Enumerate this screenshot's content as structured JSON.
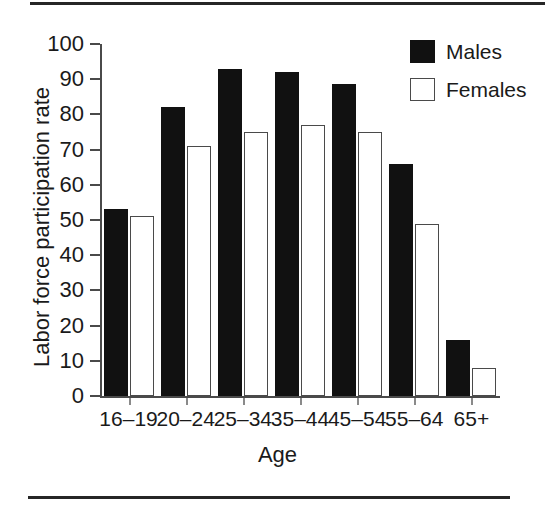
{
  "figure": {
    "has_top_rule": true,
    "has_bottom_rule": true
  },
  "legend": {
    "position": "top-right",
    "entries": [
      {
        "label": "Males",
        "swatch": "filled-black-square",
        "color": "#111111"
      },
      {
        "label": "Females",
        "swatch": "open-white-square",
        "color": "#ffffff"
      }
    ]
  },
  "axes": {
    "y_title": "Labor force participation rate",
    "x_title": "Age",
    "y_ticks": [
      "100",
      "90",
      "80",
      "70",
      "60",
      "50",
      "40",
      "30",
      "20",
      "10",
      "0"
    ]
  },
  "chart_data": {
    "type": "bar",
    "title": "",
    "subtitle": "",
    "xlabel": "Age",
    "ylabel": "Labor force participation rate",
    "categories": [
      "16–19",
      "20–24",
      "25–34",
      "35–44",
      "45–54",
      "55–64",
      "65+"
    ],
    "series": [
      {
        "name": "Males",
        "color": "#111111",
        "values": [
          53,
          82,
          93,
          92,
          88.5,
          66,
          16
        ]
      },
      {
        "name": "Females",
        "color": "#ffffff",
        "values": [
          51,
          71,
          75,
          77,
          75,
          49,
          8
        ]
      }
    ],
    "ylim": [
      0,
      100
    ],
    "ytick_values": [
      0,
      10,
      20,
      30,
      40,
      50,
      60,
      70,
      80,
      90,
      100
    ],
    "grid": false,
    "legend_position": "upper right",
    "annotations": []
  }
}
